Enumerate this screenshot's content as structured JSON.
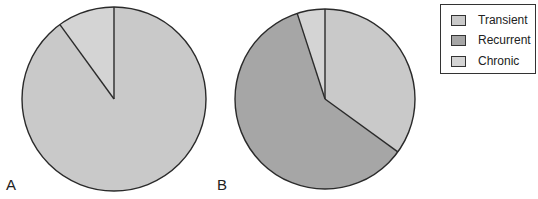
{
  "chart_data": [
    {
      "type": "pie",
      "panel": "A",
      "categories": [
        "Transient",
        "Recurrent",
        "Chronic"
      ],
      "values": [
        90,
        0,
        10
      ],
      "start_angle": "top, clockwise",
      "center": [
        114,
        99
      ],
      "radius": 92
    },
    {
      "type": "pie",
      "panel": "B",
      "categories": [
        "Transient",
        "Recurrent",
        "Chronic"
      ],
      "values": [
        35,
        60,
        5
      ],
      "start_angle": "top, clockwise",
      "center": [
        325,
        99
      ],
      "radius": 90
    }
  ],
  "legend": {
    "position": "top-right",
    "items": [
      {
        "label": "Transient",
        "color": "#c9c9c9"
      },
      {
        "label": "Recurrent",
        "color": "#a6a6a6"
      },
      {
        "label": "Chronic",
        "color": "#d4d4d4"
      }
    ]
  },
  "labels": {
    "panel_a": "A",
    "panel_b": "B"
  }
}
